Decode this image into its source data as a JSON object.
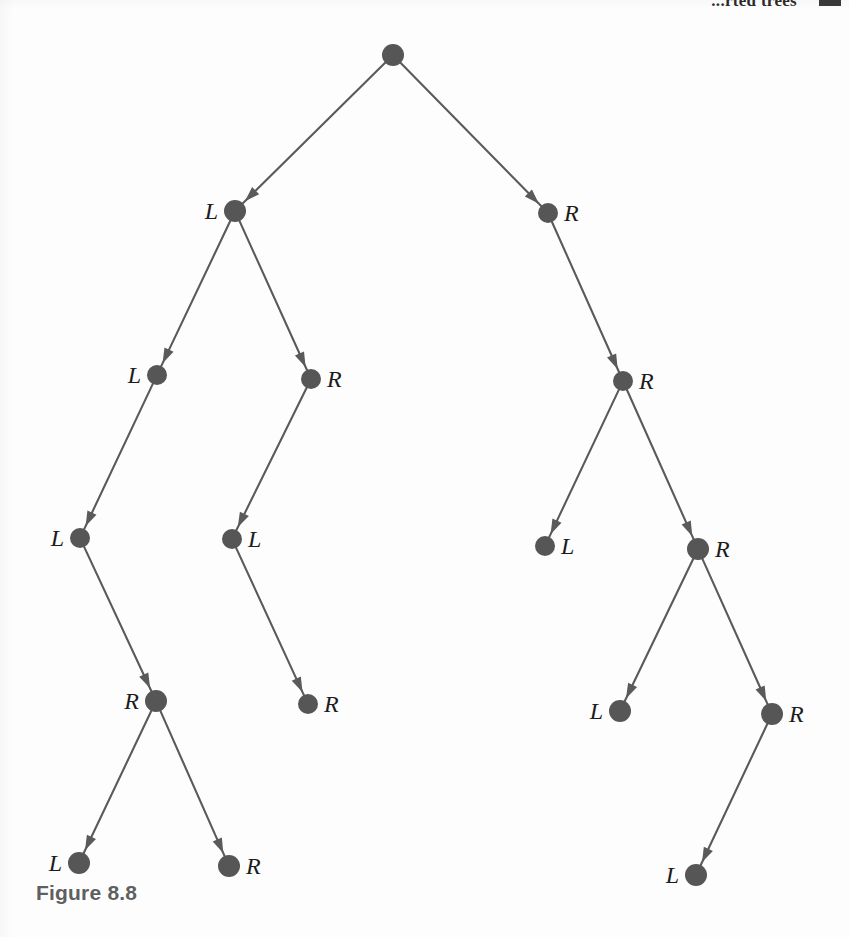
{
  "page": {
    "running_head": "...rted trees",
    "caption": "Figure 8.8",
    "background_color": "#fdfdfd",
    "node_color": "#565656",
    "edge_color": "#5a5a5a",
    "label_color": "#1c1c1c",
    "caption_color": "#5f5f5f"
  },
  "diagram": {
    "type": "binary-tree",
    "node_radius": 11,
    "nodes": [
      {
        "id": "root",
        "label": "",
        "label_side": "none",
        "x": 393,
        "y": 55,
        "r": 11
      },
      {
        "id": "L",
        "label": "L",
        "label_side": "left",
        "x": 235,
        "y": 211,
        "r": 11
      },
      {
        "id": "R",
        "label": "R",
        "label_side": "right",
        "x": 548,
        "y": 213,
        "r": 10
      },
      {
        "id": "LL",
        "label": "L",
        "label_side": "left",
        "x": 157,
        "y": 375,
        "r": 10
      },
      {
        "id": "LR",
        "label": "R",
        "label_side": "right",
        "x": 311,
        "y": 379,
        "r": 10
      },
      {
        "id": "RR",
        "label": "R",
        "label_side": "right",
        "x": 623,
        "y": 381,
        "r": 10
      },
      {
        "id": "LLL",
        "label": "L",
        "label_side": "left",
        "x": 80,
        "y": 538,
        "r": 10
      },
      {
        "id": "LRL",
        "label": "L",
        "label_side": "right",
        "x": 232,
        "y": 539,
        "r": 10
      },
      {
        "id": "RRL",
        "label": "L",
        "label_side": "right",
        "x": 545,
        "y": 546,
        "r": 10
      },
      {
        "id": "RRR",
        "label": "R",
        "label_side": "right",
        "x": 698,
        "y": 549,
        "r": 11
      },
      {
        "id": "LLLR",
        "label": "R",
        "label_side": "left",
        "x": 156,
        "y": 701,
        "r": 11
      },
      {
        "id": "LRLR",
        "label": "R",
        "label_side": "right",
        "x": 308,
        "y": 704,
        "r": 10
      },
      {
        "id": "RRRL",
        "label": "L",
        "label_side": "left",
        "x": 620,
        "y": 711,
        "r": 11
      },
      {
        "id": "RRRR",
        "label": "R",
        "label_side": "right",
        "x": 772,
        "y": 714,
        "r": 11
      },
      {
        "id": "LLLRL",
        "label": "L",
        "label_side": "left",
        "x": 79,
        "y": 863,
        "r": 11
      },
      {
        "id": "LLLRR",
        "label": "R",
        "label_side": "right",
        "x": 229,
        "y": 866,
        "r": 11
      },
      {
        "id": "RRRRL",
        "label": "L",
        "label_side": "left",
        "x": 696,
        "y": 875,
        "r": 11
      }
    ],
    "edges": [
      {
        "from": "root",
        "to": "L",
        "arrow": true
      },
      {
        "from": "root",
        "to": "R",
        "arrow": true
      },
      {
        "from": "L",
        "to": "LL",
        "arrow": true
      },
      {
        "from": "L",
        "to": "LR",
        "arrow": true
      },
      {
        "from": "R",
        "to": "RR",
        "arrow": true
      },
      {
        "from": "LL",
        "to": "LLL",
        "arrow": true
      },
      {
        "from": "LR",
        "to": "LRL",
        "arrow": true
      },
      {
        "from": "RR",
        "to": "RRL",
        "arrow": true
      },
      {
        "from": "RR",
        "to": "RRR",
        "arrow": true
      },
      {
        "from": "LLL",
        "to": "LLLR",
        "arrow": true
      },
      {
        "from": "LRL",
        "to": "LRLR",
        "arrow": true
      },
      {
        "from": "RRR",
        "to": "RRRL",
        "arrow": true
      },
      {
        "from": "RRR",
        "to": "RRRR",
        "arrow": true
      },
      {
        "from": "LLLR",
        "to": "LLLRL",
        "arrow": true
      },
      {
        "from": "LLLR",
        "to": "LLLRR",
        "arrow": true
      },
      {
        "from": "RRRR",
        "to": "RRRRL",
        "arrow": true
      }
    ]
  }
}
